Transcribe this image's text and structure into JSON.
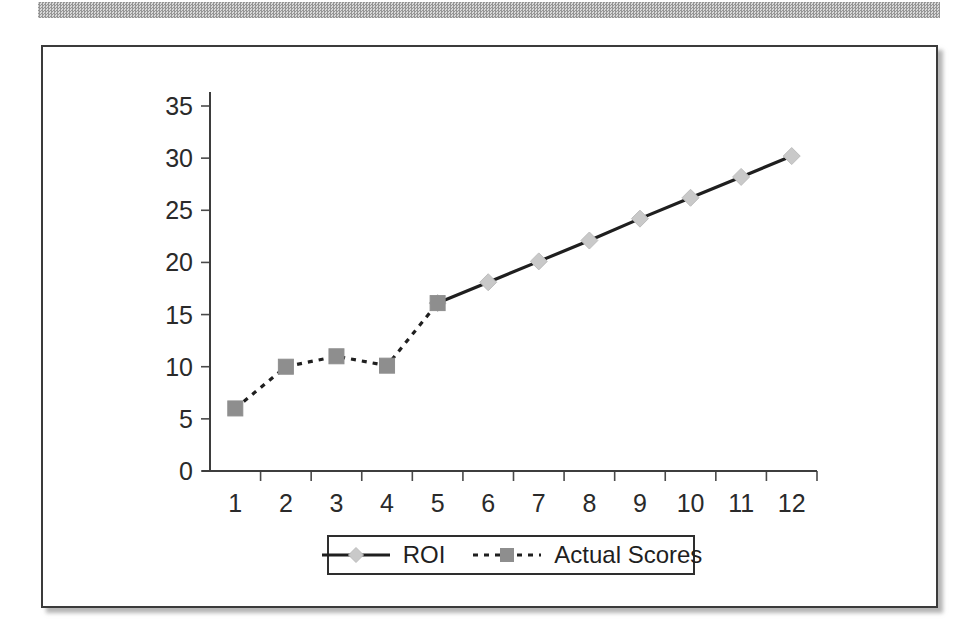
{
  "page": {
    "background_color": "#ffffff",
    "scan_band_color": "#b0b0b0"
  },
  "frame": {
    "border_color": "#3b3b3b",
    "shadow": true
  },
  "legend": {
    "position": "bottom-center",
    "entries": [
      {
        "label": "ROI",
        "marker": "diamond-marker",
        "line_style": "solid",
        "color": "#c9c9c9",
        "line_color": "#1f1f1f"
      },
      {
        "label": "Actual Scores",
        "marker": "square-marker",
        "line_style": "dotted",
        "color": "#8e8e8e",
        "line_color": "#1f1f1f"
      }
    ]
  },
  "chart_data": {
    "type": "line",
    "title": "",
    "subtitle": "",
    "xlabel": "",
    "ylabel": "",
    "x": [
      1,
      2,
      3,
      4,
      5,
      6,
      7,
      8,
      9,
      10,
      11,
      12
    ],
    "categories": [
      "1",
      "2",
      "3",
      "4",
      "5",
      "6",
      "7",
      "8",
      "9",
      "10",
      "11",
      "12"
    ],
    "xlim": [
      0.5,
      12.5
    ],
    "ylim": [
      0,
      35
    ],
    "yticks": [
      0,
      5,
      10,
      15,
      20,
      25,
      30,
      35
    ],
    "ytick_labels": [
      "0",
      "5",
      "10",
      "15",
      "20",
      "25",
      "30",
      "35"
    ],
    "grid": false,
    "legend_position": "bottom",
    "series": [
      {
        "name": "ROI",
        "line_style": "solid",
        "marker": "diamond",
        "color": "#c9c9c9",
        "x": [
          5,
          6,
          7,
          8,
          9,
          10,
          11,
          12
        ],
        "values": [
          16.1,
          18.1,
          20.1,
          22.1,
          24.2,
          26.2,
          28.2,
          30.2
        ]
      },
      {
        "name": "Actual Scores",
        "line_style": "dotted",
        "marker": "square",
        "color": "#8e8e8e",
        "x": [
          1,
          2,
          3,
          4,
          5
        ],
        "values": [
          6.0,
          10.0,
          11.0,
          10.1,
          16.1
        ]
      }
    ]
  }
}
